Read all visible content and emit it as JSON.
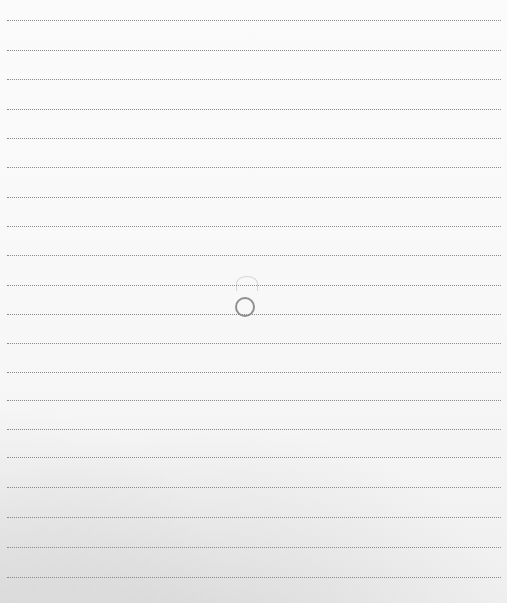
{
  "scene": {
    "description": "Photo of a sheet of lined notebook paper with a small hand-drawn circle near the center",
    "line_count": 20,
    "line_positions_y": [
      20,
      50,
      79,
      109,
      138,
      167,
      197,
      226,
      255,
      285,
      314,
      343,
      372,
      400,
      429,
      457,
      487,
      517,
      547,
      577
    ],
    "line_style": "dotted",
    "line_color": "#8a8a8a",
    "paper_color": "#fafafa",
    "shadow_color": "#c8c8c8",
    "marks": [
      {
        "type": "circle",
        "x": 235,
        "y": 297,
        "size": 20,
        "color": "#7c7c7c"
      },
      {
        "type": "faint-arc",
        "x": 236,
        "y": 276,
        "size": 20,
        "color": "#cfcfcf"
      }
    ]
  }
}
